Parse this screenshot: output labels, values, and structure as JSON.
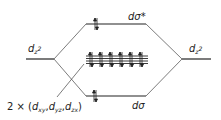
{
  "diagram": {
    "levels": {
      "left_dz2": {
        "symbol": "d",
        "sub": "z",
        "sup": "2"
      },
      "right_dz2": {
        "symbol": "d",
        "sub": "z",
        "sup": "2"
      },
      "antibonding": {
        "label": "dσ*",
        "electrons": 2
      },
      "bonding": {
        "label": "dσ",
        "electrons": 2
      },
      "nonbonding": {
        "count_lines": 4,
        "electron_pairs": 6
      }
    },
    "nonbonding_label": {
      "prefix": "2 × (",
      "o1": "d",
      "o1_sub": "xy",
      "sep1": ",",
      "o2": "d",
      "o2_sub": "yz",
      "sep2": ",",
      "o3": "d",
      "o3_sub": "zx",
      "suffix": ")"
    },
    "colors": {
      "line": "#222222",
      "text": "#222222"
    }
  }
}
